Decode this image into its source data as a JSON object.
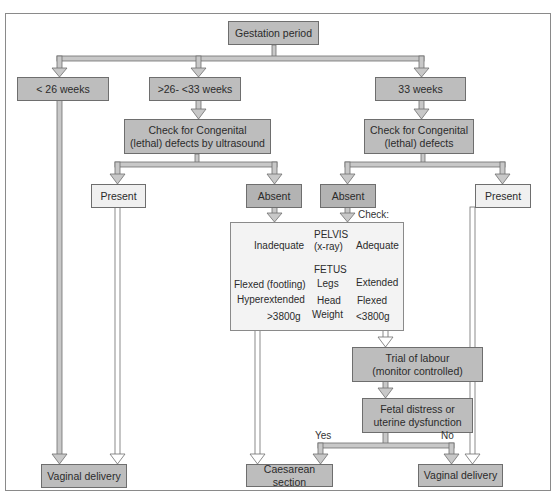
{
  "title": "Gestation period",
  "branches": {
    "lt26": "< 26 weeks",
    "mid": ">26- <33 weeks",
    "gte33": "33 weeks"
  },
  "checks": {
    "left": [
      "Check for Congenital",
      "(lethal) defects by ultrasound"
    ],
    "right": [
      "Check for Congenital",
      "(lethal) defects"
    ]
  },
  "outcomes": {
    "present_left": "Present",
    "absent_left": "Absent",
    "absent_right": "Absent",
    "present_right": "Present"
  },
  "check_panel": {
    "label": "Check:",
    "pelvis_header": [
      "PELVIS",
      "(x-ray)"
    ],
    "pelvis_left": "Inadequate",
    "pelvis_right": "Adequate",
    "fetus_header": "FETUS",
    "rows": [
      {
        "left": "Flexed (footling)",
        "middle": "Legs",
        "right": "Extended"
      },
      {
        "left": "Hyperextended",
        "middle": "Head",
        "right": "Flexed"
      },
      {
        "left": ">3800g",
        "middle": "Weight",
        "right": "<3800g"
      }
    ]
  },
  "trial": [
    "Trial of labour",
    "(monitor controlled)"
  ],
  "distress": [
    "Fetal distress or",
    "uterine dysfunction"
  ],
  "decision_labels": {
    "yes": "Yes",
    "no": "No"
  },
  "final": {
    "vaginal_left": "Vaginal delivery",
    "caesarean": "Caesarean section",
    "vaginal_right": "Vaginal delivery"
  },
  "colors": {
    "dark_box": "#bdbdbd",
    "light_box": "#f0f0f0",
    "connector_fill": "#c8c8c8",
    "connector_stroke": "#6e6e6e"
  }
}
